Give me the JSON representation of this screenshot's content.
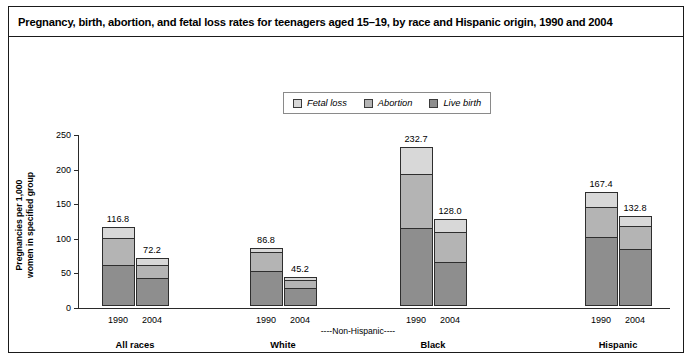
{
  "title": "Pregnancy, birth, abortion, and fetal loss rates for teenagers aged 15–19, by race and Hispanic origin, 1990 and 2004",
  "legend": {
    "items": [
      {
        "label": "Fetal loss",
        "color": "#d8d8d8",
        "icon": "legend-swatch-fetal-loss"
      },
      {
        "label": "Abortion",
        "color": "#b4b4b4",
        "icon": "legend-swatch-abortion"
      },
      {
        "label": "Live birth",
        "color": "#8e8e8e",
        "icon": "legend-swatch-live-birth"
      }
    ]
  },
  "axes": {
    "ylabel_line1": "Pregnancies per 1,000",
    "ylabel_line2": "women in specified group",
    "yticks": [
      "0",
      "50",
      "100",
      "150",
      "200",
      "250"
    ],
    "ylim": [
      0,
      250
    ],
    "bracket_label": "----Non-Hispanic----"
  },
  "chart_data": {
    "type": "bar",
    "subtype": "stacked-grouped",
    "title": "Pregnancy, birth, abortion, and fetal loss rates for teenagers aged 15–19, by race and Hispanic origin, 1990 and 2004",
    "xlabel": "",
    "ylabel": "Pregnancies per 1,000 women in specified group",
    "ylim": [
      0,
      250
    ],
    "ytick_step": 50,
    "grid": false,
    "legend_position": "top-center",
    "categories": [
      "All races",
      "White",
      "Black",
      "Hispanic"
    ],
    "years": [
      "1990",
      "2004"
    ],
    "series": [
      {
        "name": "Live birth",
        "color": "#8e8e8e",
        "values": [
          [
            59.9,
            41.1
          ],
          [
            50.8,
            26.7
          ],
          [
            112.8,
            63.1
          ],
          [
            100.3,
            82.6
          ]
        ]
      },
      {
        "name": "Abortion",
        "color": "#b4b4b4",
        "values": [
          [
            40.3,
            19.8
          ],
          [
            28.6,
            13.0
          ],
          [
            79.0,
            45.7
          ],
          [
            44.8,
            34.6
          ]
        ]
      },
      {
        "name": "Fetal loss",
        "color": "#d8d8d8",
        "values": [
          [
            16.6,
            11.3
          ],
          [
            7.4,
            5.5
          ],
          [
            40.9,
            19.2
          ],
          [
            22.3,
            15.6
          ]
        ]
      }
    ],
    "totals": [
      {
        "category": "All races",
        "year": "1990",
        "value": 116.8,
        "label": "116.8"
      },
      {
        "category": "All races",
        "year": "2004",
        "value": 72.2,
        "label": "72.2"
      },
      {
        "category": "White",
        "year": "1990",
        "value": 86.8,
        "label": "86.8"
      },
      {
        "category": "White",
        "year": "2004",
        "value": 45.2,
        "label": "45.2"
      },
      {
        "category": "Black",
        "year": "1990",
        "value": 232.7,
        "label": "232.7"
      },
      {
        "category": "Black",
        "year": "2004",
        "value": 128.0,
        "label": "128.0"
      },
      {
        "category": "Hispanic",
        "year": "1990",
        "value": 167.4,
        "label": "167.4"
      },
      {
        "category": "Hispanic",
        "year": "2004",
        "value": 132.8,
        "label": "132.8"
      }
    ],
    "annotations": [
      "----Non-Hispanic----"
    ]
  },
  "groups": [
    {
      "label": "All races",
      "bars": [
        {
          "year": "1990",
          "total": "116.8",
          "live_birth": 59.9,
          "abortion": 40.3,
          "fetal_loss": 16.6
        },
        {
          "year": "2004",
          "total": "72.2",
          "live_birth": 41.1,
          "abortion": 19.8,
          "fetal_loss": 11.3
        }
      ]
    },
    {
      "label": "White",
      "bars": [
        {
          "year": "1990",
          "total": "86.8",
          "live_birth": 50.8,
          "abortion": 28.6,
          "fetal_loss": 7.4
        },
        {
          "year": "2004",
          "total": "45.2",
          "live_birth": 26.7,
          "abortion": 13.0,
          "fetal_loss": 5.5
        }
      ]
    },
    {
      "label": "Black",
      "bars": [
        {
          "year": "1990",
          "total": "232.7",
          "live_birth": 112.8,
          "abortion": 79.0,
          "fetal_loss": 40.9
        },
        {
          "year": "2004",
          "total": "128.0",
          "live_birth": 63.1,
          "abortion": 45.7,
          "fetal_loss": 19.2
        }
      ]
    },
    {
      "label": "Hispanic",
      "bars": [
        {
          "year": "1990",
          "total": "167.4",
          "live_birth": 100.3,
          "abortion": 44.8,
          "fetal_loss": 22.3
        },
        {
          "year": "2004",
          "total": "132.8",
          "live_birth": 82.6,
          "abortion": 34.6,
          "fetal_loss": 15.6
        }
      ]
    }
  ]
}
